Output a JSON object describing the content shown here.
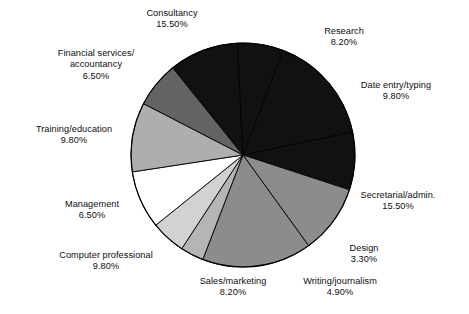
{
  "chart_data": {
    "type": "pie",
    "title": "",
    "subtitle": "",
    "xlabel": "",
    "ylabel": "",
    "legend_position": "none",
    "grid": false,
    "units": "percent",
    "total": 100.0,
    "start_angle_deg": -12,
    "direction": "clockwise",
    "categories": [
      "Research",
      "Date entry/typing",
      "Secretarial/admin.",
      "Design",
      "Writing/journalism",
      "Sales/marketing",
      "Computer professional",
      "Management",
      "Training/education",
      "Financial services/ accountancy",
      "Consultancy"
    ],
    "values": [
      8.2,
      9.8,
      15.5,
      3.3,
      4.9,
      8.2,
      9.8,
      6.5,
      9.8,
      6.5,
      15.5
    ],
    "slices": [
      {
        "label": "Research",
        "value": 8.2,
        "value_text": "8.20%",
        "color": "#111111"
      },
      {
        "label": "Date entry/typing",
        "value": 9.8,
        "value_text": "9.80%",
        "color": "#8c8c8c"
      },
      {
        "label": "Secretarial/admin.",
        "value": 15.5,
        "value_text": "15.50%",
        "color": "#8c8c8c"
      },
      {
        "label": "Design",
        "value": 3.3,
        "value_text": "3.30%",
        "color": "#b5b5b5"
      },
      {
        "label": "Writing/journalism",
        "value": 4.9,
        "value_text": "4.90%",
        "color": "#d2d2d2"
      },
      {
        "label": "Sales/marketing",
        "value": 8.2,
        "value_text": "8.20%",
        "color": "#ffffff"
      },
      {
        "label": "Computer professional",
        "value": 9.8,
        "value_text": "9.80%",
        "color": "#aeaeae"
      },
      {
        "label": "Management",
        "value": 6.5,
        "value_text": "6.50%",
        "color": "#636363"
      },
      {
        "label": "Training/education",
        "value": 9.8,
        "value_text": "9.80%",
        "color": "#111111"
      },
      {
        "label": "Financial services/ accountancy",
        "value": 6.5,
        "value_text": "6.50%",
        "color": "#111111"
      },
      {
        "label": "Consultancy",
        "value": 15.5,
        "value_text": "15.50%",
        "color": "#111111"
      }
    ],
    "outline_color": "#000000"
  },
  "labels": {
    "consultancy": {
      "name": "Consultancy",
      "value": "15.50%"
    },
    "research": {
      "name": "Research",
      "value": "8.20%"
    },
    "data_entry": {
      "name": "Date entry/typing",
      "value": "9.80%"
    },
    "secretarial": {
      "name": "Secretarial/admin.",
      "value": "15.50%"
    },
    "design": {
      "name": "Design",
      "value": "3.30%"
    },
    "writing": {
      "name": "Writing/journalism",
      "value": "4.90%"
    },
    "sales": {
      "name": "Sales/marketing",
      "value": "8.20%"
    },
    "computer_prof": {
      "name": "Computer professional",
      "value": "9.80%"
    },
    "management": {
      "name": "Management",
      "value": "6.50%"
    },
    "training": {
      "name": "Training/education",
      "value": "9.80%"
    },
    "financial": {
      "name_line1": "Financial services/",
      "name_line2": "accountancy",
      "value": "6.50%"
    }
  }
}
